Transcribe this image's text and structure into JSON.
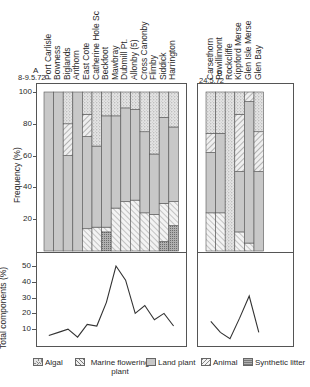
{
  "panel_a": {
    "letter": "A",
    "date": "8-9.5.72",
    "sites": [
      "Port Carlisle",
      "Bowness",
      "Biglands",
      "Anthorn",
      "East Cote",
      "Catherine Hole Sc",
      "Beckfoot",
      "Mawbray",
      "Dubmill Pt.",
      "Allonby (5)",
      "Cross Canonby",
      "Flimby",
      "Siddick",
      "Harrington"
    ]
  },
  "panel_b": {
    "letter": "B",
    "date": "24.5.72",
    "sites": [
      "Carsethorn",
      "Powillimont",
      "Rockcliffe",
      "Kippford Merse",
      "Glen Isle Merse",
      "Glen Bay"
    ]
  },
  "axes": {
    "frequency_label": "Frequency (%)",
    "frequency_ticks": [
      "100",
      "80",
      "60",
      "40",
      "20"
    ],
    "total_label": "Total components (%)",
    "total_ticks": [
      "50",
      "40",
      "30",
      "20",
      "10"
    ]
  },
  "legend": [
    {
      "key": "algal",
      "label": "Algal"
    },
    {
      "key": "marine",
      "label": "Marine flowering plant"
    },
    {
      "key": "land",
      "label": "Land plant"
    },
    {
      "key": "animal",
      "label": "Animal"
    },
    {
      "key": "synthetic",
      "label": "Synthetic litter"
    }
  ],
  "colors": {
    "land": "#c9c9c9",
    "algal": "#dcdcdc",
    "frame": "#555555",
    "line": "#333333"
  },
  "chart_data": [
    {
      "type": "bar",
      "stacked": true,
      "title": "A 8-9.5.72",
      "ylabel": "Frequency (%)",
      "ylim": [
        0,
        100
      ],
      "categories": [
        "Port Carlisle",
        "Bowness",
        "Biglands",
        "Anthorn",
        "East Cote",
        "Catherine Hole Sc",
        "Beckfoot",
        "Mawbray",
        "Dubmill Pt.",
        "Allonby (5)",
        "Cross Canonby",
        "Flimby",
        "Siddick",
        "Harrington"
      ],
      "series": [
        {
          "name": "Synthetic litter",
          "values": [
            0,
            0,
            0,
            0,
            0,
            0,
            12,
            0,
            0,
            0,
            0,
            0,
            6,
            16
          ]
        },
        {
          "name": "Animal",
          "values": [
            0,
            0,
            0,
            0,
            14,
            15,
            3,
            27,
            31,
            32,
            24,
            23,
            24,
            15
          ]
        },
        {
          "name": "Land plant",
          "values": [
            100,
            100,
            60,
            100,
            58,
            51,
            70,
            58,
            59,
            57,
            51,
            38,
            54,
            47
          ]
        },
        {
          "name": "Marine flowering plant",
          "values": [
            0,
            0,
            20,
            0,
            14,
            0,
            0,
            0,
            0,
            0,
            0,
            0,
            0,
            0
          ]
        },
        {
          "name": "Algal",
          "values": [
            0,
            0,
            20,
            0,
            14,
            34,
            15,
            15,
            10,
            11,
            25,
            39,
            16,
            22
          ]
        }
      ]
    },
    {
      "type": "bar",
      "stacked": true,
      "title": "B 24.5.72",
      "ylabel": "Frequency (%)",
      "ylim": [
        0,
        100
      ],
      "categories": [
        "Carsethorn",
        "Powillimont",
        "Rockcliffe",
        "Kippford Merse",
        "Glen Isle Merse",
        "Glen Bay"
      ],
      "series": [
        {
          "name": "Synthetic litter",
          "values": [
            0,
            0,
            0,
            0,
            0,
            0
          ]
        },
        {
          "name": "Animal",
          "values": [
            24,
            24,
            0,
            12,
            5,
            0
          ]
        },
        {
          "name": "Land plant",
          "values": [
            38,
            50,
            0,
            38,
            89,
            50
          ]
        },
        {
          "name": "Marine flowering plant",
          "values": [
            12,
            0,
            0,
            36,
            6,
            25
          ]
        },
        {
          "name": "Algal",
          "values": [
            26,
            26,
            100,
            14,
            0,
            25
          ]
        }
      ]
    },
    {
      "type": "line",
      "title": "Total components A",
      "ylabel": "Total components (%)",
      "ylim": [
        0,
        55
      ],
      "categories": [
        "Port Carlisle",
        "Bowness",
        "Biglands",
        "Anthorn",
        "East Cote",
        "Catherine Hole Sc",
        "Beckfoot",
        "Mawbray",
        "Dubmill Pt.",
        "Allonby (5)",
        "Cross Canonby",
        "Flimby",
        "Siddick",
        "Harrington"
      ],
      "values": [
        6,
        8,
        10,
        5,
        13,
        12,
        27,
        50,
        41,
        20,
        25,
        16,
        20,
        12
      ]
    },
    {
      "type": "line",
      "title": "Total components B",
      "ylabel": "Total components (%)",
      "ylim": [
        0,
        55
      ],
      "categories": [
        "Carsethorn",
        "Powillimont",
        "Rockcliffe",
        "Kippford Merse",
        "Glen Isle Merse",
        "Glen Bay"
      ],
      "values": [
        15,
        8,
        4,
        17,
        31,
        8
      ]
    }
  ]
}
